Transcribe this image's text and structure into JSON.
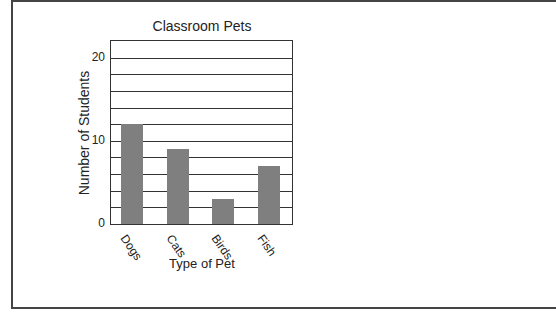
{
  "chart_data": {
    "type": "bar",
    "title": "Classroom Pets",
    "xlabel": "Type of Pet",
    "ylabel": "Number of Students",
    "categories": [
      "Dogs",
      "Cats",
      "Birds",
      "Fish"
    ],
    "values": [
      12,
      9,
      3,
      7
    ],
    "ylim": [
      0,
      22
    ],
    "yticks": [
      0,
      10,
      20
    ],
    "grid": true,
    "grid_step": 2,
    "bar_color": "#7f7f7f"
  }
}
